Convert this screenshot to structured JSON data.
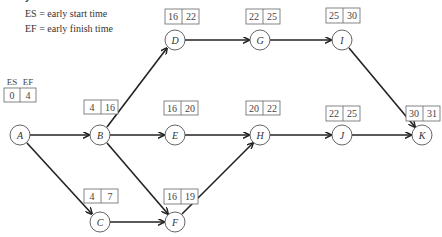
{
  "legend": {
    "title": "y start and finish times.",
    "es": "ES = early start time",
    "ef": "EF = early finish time"
  },
  "header": {
    "es": "ES",
    "ef": "EF"
  },
  "nodes": {
    "A": {
      "label": "A",
      "es": "0",
      "ef": "4"
    },
    "B": {
      "label": "B",
      "es": "4",
      "ef": "16"
    },
    "C": {
      "label": "C",
      "es": "4",
      "ef": "7"
    },
    "D": {
      "label": "D",
      "es": "16",
      "ef": "22"
    },
    "E": {
      "label": "E",
      "es": "16",
      "ef": "20"
    },
    "F": {
      "label": "F",
      "es": "16",
      "ef": "19"
    },
    "G": {
      "label": "G",
      "es": "22",
      "ef": "25"
    },
    "H": {
      "label": "H",
      "es": "20",
      "ef": "22"
    },
    "I": {
      "label": "I",
      "es": "25",
      "ef": "30"
    },
    "J": {
      "label": "J",
      "es": "22",
      "ef": "25"
    },
    "K": {
      "label": "K",
      "es": "30",
      "ef": "31"
    }
  },
  "edges": [
    [
      "A",
      "B"
    ],
    [
      "A",
      "C"
    ],
    [
      "B",
      "D"
    ],
    [
      "B",
      "E"
    ],
    [
      "B",
      "F"
    ],
    [
      "C",
      "F"
    ],
    [
      "D",
      "G"
    ],
    [
      "G",
      "I"
    ],
    [
      "E",
      "H"
    ],
    [
      "F",
      "H"
    ],
    [
      "H",
      "J"
    ],
    [
      "I",
      "K"
    ],
    [
      "J",
      "K"
    ]
  ]
}
